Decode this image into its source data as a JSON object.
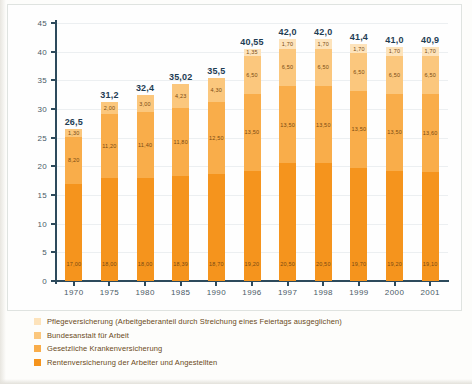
{
  "chart_data": {
    "type": "bar",
    "subtype": "stacked-bar",
    "title": "",
    "xlabel": "",
    "ylabel": "",
    "ylim": [
      0,
      45
    ],
    "yticks": [
      0,
      5,
      10,
      15,
      20,
      25,
      30,
      35,
      40,
      45
    ],
    "ytick_labels": [
      "0",
      "5",
      "10",
      "15",
      "20",
      "25",
      "30",
      "35",
      "40",
      "45"
    ],
    "grid": true,
    "legend_position": "bottom-left",
    "categories": [
      "1970",
      "1975",
      "1980",
      "1985",
      "1990",
      "1996",
      "1997",
      "1998",
      "1999",
      "2000",
      "2001"
    ],
    "totals": [
      "26,5",
      "31,2",
      "32,4",
      "35,02",
      "35,5",
      "40,55",
      "42,0",
      "42,0",
      "41,4",
      "41,0",
      "40,9"
    ],
    "totals_numeric": [
      26.5,
      31.2,
      32.4,
      35.02,
      35.5,
      40.55,
      42.0,
      42.0,
      41.4,
      41.0,
      40.9
    ],
    "series": [
      {
        "name": "Rentenversicherung der Arbeiter und Angestellten",
        "color": "#f5941d",
        "values": [
          17.0,
          18.0,
          18.0,
          18.39,
          18.7,
          19.2,
          20.5,
          20.5,
          19.7,
          19.2,
          19.1
        ],
        "labels": [
          "17,00",
          "18,00",
          "18,00",
          "18,39",
          "18,70",
          "19,20",
          "20,50",
          "20,50",
          "19,70",
          "19,20",
          "19,10"
        ]
      },
      {
        "name": "Gesetzliche Krankenversicherung",
        "color": "#f9ad4a",
        "values": [
          8.2,
          11.2,
          11.4,
          11.8,
          12.5,
          13.5,
          13.5,
          13.5,
          13.5,
          13.5,
          13.6
        ],
        "labels": [
          "8,20",
          "11,20",
          "11,40",
          "11,80",
          "12,50",
          "13,50",
          "13,50",
          "13,50",
          "13,50",
          "13,50",
          "13,60"
        ]
      },
      {
        "name": "Bundesanstalt für Arbeit",
        "color": "#fbc77d",
        "values": [
          1.3,
          2.0,
          3.0,
          4.23,
          4.3,
          6.5,
          6.5,
          6.5,
          6.5,
          6.5,
          6.5
        ],
        "labels": [
          "1,30",
          "2,00",
          "3,00",
          "4,23",
          "4,30",
          "6,50",
          "6,50",
          "6,50",
          "6,50",
          "6,50",
          "6,50"
        ]
      },
      {
        "name": "Pflegeversicherung (Arbeitgeberanteil durch Streichung eines Feiertags ausgeglichen)",
        "color": "#fde3bb",
        "values": [
          0,
          0,
          0,
          0,
          0,
          1.35,
          1.7,
          1.7,
          1.7,
          1.7,
          1.7
        ],
        "labels": [
          "",
          "",
          "",
          "",
          "",
          "1,35",
          "1,70",
          "1,70",
          "1,70",
          "1,70",
          "1,70"
        ]
      }
    ]
  },
  "legend": {
    "items": [
      {
        "label": "Pflegeversicherung (Arbeitgeberanteil durch Streichung eines Feiertags ausgeglichen)",
        "color": "#fde3bb"
      },
      {
        "label": "Bundesanstalt für Arbeit",
        "color": "#fbc77d"
      },
      {
        "label": "Gesetzliche Krankenversicherung",
        "color": "#f9ad4a"
      },
      {
        "label": "Rentenversicherung der Arbeiter und Angestellten",
        "color": "#f5941d"
      }
    ]
  },
  "colors": {
    "axis": "#2d4a5c",
    "grid": "#eceff1",
    "total_label": "#1f3d54",
    "segment_label": "#7a4a12",
    "panel_border": "#dfe3e0",
    "background": "#fefefe"
  }
}
